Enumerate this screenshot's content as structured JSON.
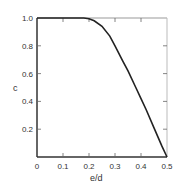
{
  "chart_data": {
    "type": "line",
    "title": "",
    "xlabel": "e/d",
    "ylabel": "c",
    "xlim": [
      0,
      0.5
    ],
    "ylim": [
      0,
      1.0
    ],
    "grid": false,
    "legend": null,
    "x_ticks": [
      "0",
      "0.1",
      "0.2",
      "0.3",
      "0.4",
      "0.5"
    ],
    "y_ticks": [
      "0.2",
      "0.4",
      "0.6",
      "0.8",
      "1.0"
    ],
    "series": [
      {
        "name": "c",
        "x": [
          0,
          0.05,
          0.1,
          0.15,
          0.18,
          0.2,
          0.22,
          0.25,
          0.28,
          0.3,
          0.33,
          0.35,
          0.38,
          0.4,
          0.42,
          0.45,
          0.48,
          0.5
        ],
        "y": [
          1.0,
          1.0,
          1.0,
          1.0,
          1.0,
          0.995,
          0.98,
          0.94,
          0.87,
          0.8,
          0.69,
          0.62,
          0.5,
          0.42,
          0.34,
          0.21,
          0.08,
          0.0
        ]
      }
    ]
  },
  "labels": {
    "xlabel": "e/d",
    "ylabel": "c",
    "x_ticks": [
      "0",
      "0.1",
      "0.2",
      "0.3",
      "0.4",
      "0.5"
    ],
    "y_ticks": [
      "0.2",
      "0.4",
      "0.6",
      "0.8",
      "1.0"
    ]
  },
  "colors": {
    "line": "#222222",
    "axis": "#333333",
    "frame": "#bbbbbb"
  }
}
